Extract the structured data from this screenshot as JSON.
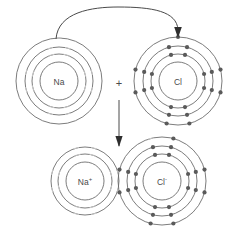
{
  "diagram": {
    "type": "bohr-model-electron-transfer",
    "background_color": "#ffffff",
    "shell_color": "#6d6d6d",
    "electron_dot_color": "#5a5a5a",
    "electron_tick_color": "#c9c9c9",
    "label_color": "#4a4a4a",
    "arrow_color": "#4a4a4a"
  },
  "reactants": {
    "sodium_atom": {
      "label": "Na",
      "superscript": "",
      "center": {
        "x": 59,
        "y": 81
      },
      "nucleus_radius": 19,
      "shells": [
        {
          "index": 1,
          "radius": 27,
          "electron_count": 8,
          "electron_style": "tick"
        },
        {
          "index": 2,
          "radius": 34,
          "electron_count": 8,
          "electron_style": "tick"
        },
        {
          "index": 3,
          "radius": 43,
          "electron_count": 1,
          "electron_style": "tick"
        }
      ]
    },
    "plus_operator": {
      "symbol": "+",
      "x": 119,
      "y": 83
    },
    "chlorine_atom": {
      "label": "Cl",
      "superscript": "",
      "center": {
        "x": 178,
        "y": 81
      },
      "nucleus_radius": 19,
      "shells": [
        {
          "index": 1,
          "radius": 27,
          "electron_count": 8,
          "electron_style": "dot"
        },
        {
          "index": 2,
          "radius": 35,
          "electron_count": 8,
          "electron_style": "dot"
        },
        {
          "index": 3,
          "radius": 44,
          "electron_count": 7,
          "electron_style": "dot"
        }
      ]
    }
  },
  "products": {
    "sodium_ion": {
      "label": "Na",
      "superscript": "+",
      "center": {
        "x": 85,
        "y": 181
      },
      "nucleus_radius": 19,
      "shells": [
        {
          "index": 1,
          "radius": 27,
          "electron_count": 8,
          "electron_style": "tick"
        },
        {
          "index": 2,
          "radius": 34,
          "electron_count": 8,
          "electron_style": "tick"
        }
      ]
    },
    "chloride_ion": {
      "label": "Cl",
      "superscript": "-",
      "center": {
        "x": 162,
        "y": 181
      },
      "nucleus_radius": 19,
      "shells": [
        {
          "index": 1,
          "radius": 27,
          "electron_count": 8,
          "electron_style": "dot"
        },
        {
          "index": 2,
          "radius": 35,
          "electron_count": 8,
          "electron_style": "dot"
        },
        {
          "index": 3,
          "radius": 44,
          "electron_count": 8,
          "electron_style": "dot",
          "transferred_index": 0
        }
      ]
    }
  },
  "annotations": {
    "transfer_arrow": {
      "name": "electron-transfer-arrow",
      "from": {
        "x": 56,
        "y": 39
      },
      "to": {
        "x": 178,
        "y": 35
      },
      "path": "M 56 39 C 58 12, 92 7, 118 7 C 152 7, 177 11, 178 30",
      "head_points": "178,38 174.2,27 181.8,27"
    },
    "reaction_arrow": {
      "name": "reaction-direction-arrow",
      "from": {
        "x": 119,
        "y": 100
      },
      "to": {
        "x": 119,
        "y": 146
      },
      "head_points": "119,147 115.4,136 122.6,136"
    }
  },
  "chart_data": {
    "type": "diagram",
    "species": [
      {
        "name": "Na",
        "role": "reactant",
        "shell_electrons": [
          8,
          8,
          1
        ],
        "total_electrons": 17,
        "charge": ""
      },
      {
        "name": "Cl",
        "role": "reactant",
        "shell_electrons": [
          8,
          8,
          7
        ],
        "total_electrons": 23,
        "charge": ""
      },
      {
        "name": "Na+",
        "role": "product",
        "shell_electrons": [
          8,
          8
        ],
        "total_electrons": 16,
        "charge": "+"
      },
      {
        "name": "Cl-",
        "role": "product",
        "shell_electrons": [
          8,
          8,
          8
        ],
        "total_electrons": 24,
        "charge": "-"
      }
    ],
    "transfers": [
      {
        "from": "Na",
        "to": "Cl",
        "electrons": 1
      }
    ]
  }
}
